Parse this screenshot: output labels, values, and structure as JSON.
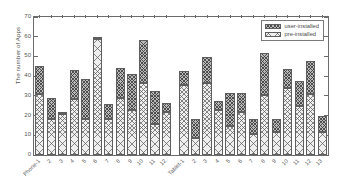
{
  "chart_data": {
    "type": "bar",
    "stacked": true,
    "title": "",
    "subtitle": "",
    "xlabel": "",
    "ylabel": "The number of Apps",
    "ylim": [
      0,
      70
    ],
    "ytick_labels": [
      "0",
      "10",
      "20",
      "30",
      "40",
      "50",
      "60",
      "70"
    ],
    "ytick_values": [
      0,
      10,
      20,
      30,
      40,
      50,
      60,
      70
    ],
    "grid": false,
    "legend_position": "top-right",
    "legend": [
      "user-installed",
      "pre-installed"
    ],
    "categories": [
      "Phone-1",
      "2",
      "3",
      "4",
      "5",
      "6",
      "7",
      "8",
      "9",
      "10",
      "11",
      "12",
      "Tablet-1",
      "2",
      "3",
      "4",
      "5",
      "6",
      "7",
      "8",
      "9",
      "10",
      "11",
      "12",
      "13"
    ],
    "series": [
      {
        "name": "pre-installed",
        "values": [
          31,
          18.5,
          21,
          28.5,
          18.5,
          59,
          18.5,
          29,
          23,
          36.5,
          15.5,
          22,
          35.5,
          8.5,
          36.5,
          23,
          14.5,
          22,
          10.5,
          30.5,
          11.5,
          34,
          25,
          31,
          11.5
        ]
      },
      {
        "name": "user-installed",
        "values": [
          14,
          10.5,
          1,
          14.5,
          20,
          0.5,
          7.5,
          15,
          18,
          22,
          17,
          4.5,
          7,
          10,
          13,
          4.5,
          17,
          9.5,
          8,
          21,
          7,
          9.5,
          12.5,
          16.5,
          8.5
        ]
      }
    ],
    "totals": [
      45,
      29,
      22,
      43,
      38.5,
      59.5,
      26,
      44,
      41,
      58.5,
      32.5,
      26.5,
      42.5,
      18.5,
      49.5,
      27.5,
      31.5,
      31.5,
      18.5,
      51.5,
      18.5,
      43.5,
      37.5,
      47.5,
      20
    ]
  },
  "colors": {
    "axis": "#6b6b6b",
    "text": "#4a4a4a",
    "user_installed_fill": "#b9b9b9",
    "pre_installed_fill": "#efefef",
    "background": "#ffffff"
  }
}
